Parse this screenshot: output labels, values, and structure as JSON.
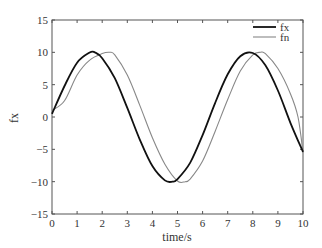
{
  "chart_data": {
    "type": "line",
    "title": "",
    "xlabel": "time/s",
    "ylabel": "fx",
    "xlim": [
      0,
      10
    ],
    "ylim": [
      -15,
      15
    ],
    "xticks": [
      0,
      1,
      2,
      3,
      4,
      5,
      6,
      7,
      8,
      9,
      10
    ],
    "yticks": [
      -15,
      -10,
      -5,
      0,
      5,
      10,
      15
    ],
    "grid": false,
    "legend_position": "upper right",
    "series": [
      {
        "name": "fx",
        "color": "#111111",
        "style": "solid-thick",
        "x": [
          0,
          0.5,
          1.0,
          1.5,
          1.7,
          2.0,
          2.5,
          3.0,
          3.5,
          4.0,
          4.5,
          4.8,
          5.0,
          5.5,
          6.0,
          6.5,
          7.0,
          7.5,
          8.0,
          8.5,
          9.0,
          9.5,
          10.0
        ],
        "y": [
          0.5,
          4.8,
          8.4,
          9.97,
          10.0,
          9.1,
          6.0,
          1.4,
          -3.5,
          -7.6,
          -9.8,
          -10.0,
          -9.6,
          -7.1,
          -2.8,
          2.2,
          6.6,
          9.4,
          9.9,
          8.0,
          4.1,
          -0.9,
          -5.4
        ]
      },
      {
        "name": "fn",
        "color": "#888888",
        "style": "solid-thin-stepped",
        "x": [
          0,
          0.5,
          1.0,
          1.5,
          2.0,
          2.3,
          2.5,
          3.0,
          3.5,
          4.0,
          4.5,
          5.0,
          5.3,
          5.5,
          6.0,
          6.5,
          7.0,
          7.5,
          8.0,
          8.3,
          8.5,
          9.0,
          9.5,
          9.8,
          10.0
        ],
        "y": [
          1.0,
          2.5,
          6.5,
          8.8,
          9.8,
          10.0,
          9.6,
          6.5,
          1.8,
          -3.2,
          -7.3,
          -9.9,
          -10.0,
          -9.6,
          -6.8,
          -2.2,
          2.7,
          7.1,
          9.6,
          10.0,
          9.8,
          7.5,
          3.6,
          0.0,
          -5.5
        ]
      }
    ]
  }
}
